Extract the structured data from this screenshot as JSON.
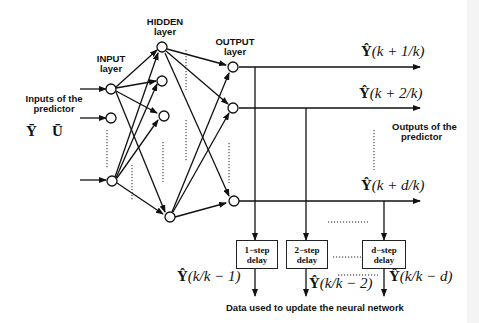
{
  "diagram": {
    "layers": {
      "input": {
        "title": "INPUT",
        "subtitle": "layer"
      },
      "hidden": {
        "title": "HIDDEN",
        "subtitle": "layer"
      },
      "output": {
        "title": "OUTPUT",
        "subtitle": "layer"
      }
    },
    "inputs_label": {
      "line1": "Inputs of the",
      "line2": "predictor"
    },
    "input_symbols": {
      "y": "Ȳ",
      "u": "Ū"
    },
    "outputs_label": {
      "line1": "Outputs of the",
      "line2": "predictor"
    },
    "outputs": [
      {
        "hat": "Ŷ",
        "expr": "(k + 1/k)"
      },
      {
        "hat": "Ŷ",
        "expr": "(k + 2/k)"
      },
      {
        "hat": "Ŷ",
        "expr": "(k + d/k)"
      }
    ],
    "delays": [
      {
        "line1": "1−step",
        "line2": "delay"
      },
      {
        "line1": "2−step",
        "line2": "delay"
      },
      {
        "line1": "d−step",
        "line2": "delay"
      }
    ],
    "delayed_outputs": [
      {
        "hat": "Ŷ",
        "expr": "(k/k − 1)"
      },
      {
        "hat": "Ŷ",
        "expr": "(k/k − 2)"
      },
      {
        "hat": "Ŷ",
        "expr": "(k/k − d)"
      }
    ],
    "footer": "Data used to update the neural network"
  }
}
